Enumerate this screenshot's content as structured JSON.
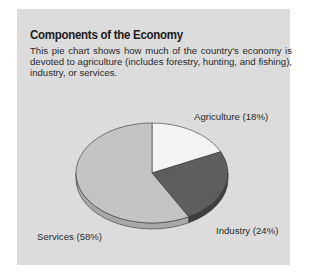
{
  "title": "Components of the Economy",
  "description": "This pie chart shows how much of the country's economy is devoted to agriculture (includes forestry, hunting, and fishing), industry, or services.",
  "labels": {
    "agriculture": "Agriculture (18%)",
    "industry": "Industry (24%)",
    "services": "Services (58%)"
  },
  "colors": {
    "panel": "#dcdcdc",
    "agriculture": "#f4f4f4",
    "industry": "#5e5e5e",
    "services": "#c4c4c4"
  },
  "chart_data": {
    "type": "pie",
    "title": "Components of the Economy",
    "categories": [
      "Agriculture",
      "Industry",
      "Services"
    ],
    "values": [
      18,
      24,
      58
    ],
    "unit": "%",
    "labels": [
      "Agriculture (18%)",
      "Industry (24%)",
      "Services (58%)"
    ],
    "style": "3D pie, slices start at 12 o'clock and go clockwise",
    "legend": "none (direct labels)"
  }
}
